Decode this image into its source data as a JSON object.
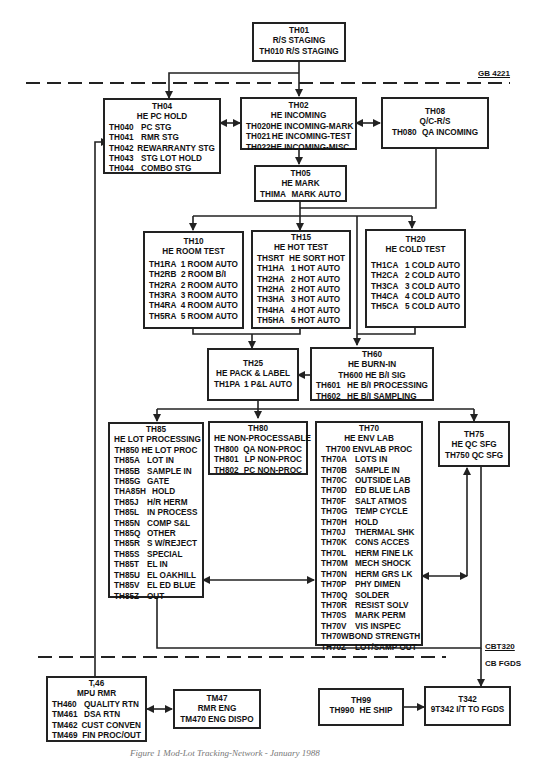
{
  "diagram": {
    "boundaries": {
      "top_label": "GB 4221",
      "bottom_label_top": "CBT320",
      "bottom_label_bottom": "CB FGDS"
    },
    "caption": "Figure 1 Mod-Lot Tracking-Network - January 1988",
    "nodes": {
      "th01": {
        "id": "TH01",
        "title": "R/S STAGING",
        "lines": [
          "TH010 R/S STAGING"
        ]
      },
      "th04": {
        "id": "TH04",
        "title": "HE PC HOLD",
        "rows": [
          {
            "code": "TH040",
            "desc": "PC STG"
          },
          {
            "code": "TH041",
            "desc": "RMR STG"
          },
          {
            "code": "TH042",
            "desc": "REWARRANTY STG"
          },
          {
            "code": "TH043",
            "desc": "STG LOT HOLD"
          },
          {
            "code": "TH044",
            "desc": "COMBO STG"
          }
        ]
      },
      "th02": {
        "id": "TH02",
        "title": "HE INCOMING",
        "rows": [
          {
            "code": "TH020",
            "desc": "HE INCOMING-MARK"
          },
          {
            "code": "TH021",
            "desc": "HE INCOMING-TEST"
          },
          {
            "code": "TH022",
            "desc": "HE INCOMING-MISC."
          }
        ]
      },
      "th08": {
        "id": "TH08",
        "title": "Q/C-R/S",
        "rows": [
          {
            "code": "TH080",
            "desc": "QA INCOMING"
          }
        ]
      },
      "th05": {
        "id": "TH05",
        "title": "HE MARK",
        "rows": [
          {
            "code": "THIMA",
            "desc": "MARK AUTO"
          }
        ]
      },
      "th10": {
        "id": "TH10",
        "title": "HE ROOM TEST",
        "rows": [
          {
            "code": "TH1RA",
            "desc": "1 ROOM AUTO"
          },
          {
            "code": "TH2RB",
            "desc": "2 ROOM B/I"
          },
          {
            "code": "TH2RA",
            "desc": "2 ROOM AUTO"
          },
          {
            "code": "TH3RA",
            "desc": "3 ROOM AUTO"
          },
          {
            "code": "TH4RA",
            "desc": "4 ROOM AUTO"
          },
          {
            "code": "TH5RA",
            "desc": "5 ROOM AUTO"
          }
        ]
      },
      "th15": {
        "id": "TH15",
        "title": "HE HOT TEST",
        "rows": [
          {
            "code": "THSRT",
            "desc": "HE SORT HOT"
          },
          {
            "code": "TH1HA",
            "desc": "1 HOT AUTO"
          },
          {
            "code": "TH2HA",
            "desc": "2 HOT AUTO"
          },
          {
            "code": "TH2HA",
            "desc": "2 HOT AUTO"
          },
          {
            "code": "TH3HA",
            "desc": "3 HOT AUTO"
          },
          {
            "code": "TH4HA",
            "desc": "4 HOT AUTO"
          },
          {
            "code": "TH5HA",
            "desc": "5 HOT AUTO"
          }
        ]
      },
      "th20": {
        "id": "TH20",
        "title": "HE COLD TEST",
        "rows": [
          {
            "code": "TH1CA",
            "desc": "1 COLD AUTO"
          },
          {
            "code": "TH2CA",
            "desc": "2 COLD AUTO"
          },
          {
            "code": "TH3CA",
            "desc": "3 COLD AUTO"
          },
          {
            "code": "TH4CA",
            "desc": "4 COLD AUTO"
          },
          {
            "code": "TH5CA",
            "desc": "5 COLD AUTO"
          }
        ]
      },
      "th25": {
        "id": "TH25",
        "title": "HE PACK & LABEL",
        "rows": [
          {
            "code": "TH1PA",
            "desc": "1 P&L AUTO"
          }
        ]
      },
      "th60": {
        "id": "TH60",
        "title": "HE BURN-IN",
        "subtitle": "TH600 HE B/I SIG",
        "rows": [
          {
            "code": "TH601",
            "desc": "HE B/I PROCESSING"
          },
          {
            "code": "TH602",
            "desc": "HE B/I SAMPLING"
          }
        ]
      },
      "th85": {
        "id": "TH85",
        "title": "HE LOT PROCESSING",
        "subtitle": "TH850 HE LOT PROC",
        "rows": [
          {
            "code": "TH85A",
            "desc": "LOT IN"
          },
          {
            "code": "TH85B",
            "desc": "SAMPLE IN"
          },
          {
            "code": "TH85G",
            "desc": "GATE"
          },
          {
            "code": "THA85H",
            "desc": "HOLD"
          },
          {
            "code": "TH85J",
            "desc": "H/R HERM"
          },
          {
            "code": "TH85L",
            "desc": "IN PROCESS"
          },
          {
            "code": "TH85N",
            "desc": "COMP S&L"
          },
          {
            "code": "TH85Q",
            "desc": "OTHER"
          },
          {
            "code": "TH85R",
            "desc": "S W/REJECT"
          },
          {
            "code": "TH85S",
            "desc": "SPECIAL"
          },
          {
            "code": "TH85T",
            "desc": "EL IN"
          },
          {
            "code": "TH85U",
            "desc": "EL OAKHILL"
          },
          {
            "code": "TH85V",
            "desc": "EL ED BLUE"
          },
          {
            "code": "TH85Z",
            "desc": "OUT"
          }
        ]
      },
      "th80": {
        "id": "TH80",
        "title": "HE NON-PROCESSABLE",
        "rows": [
          {
            "code": "TH800",
            "desc": "QA NON-PROC"
          },
          {
            "code": "TH801",
            "desc": "LP NON-PROC"
          },
          {
            "code": "TH802",
            "desc": "PC NON-PROC"
          }
        ]
      },
      "th70": {
        "id": "TH70",
        "title": "HE ENV LAB",
        "subtitle": "TH700 ENVLAB PROC",
        "rows": [
          {
            "code": "TH70A",
            "desc": "LOTS IN"
          },
          {
            "code": "TH70B",
            "desc": "SAMPLE IN"
          },
          {
            "code": "TH70C",
            "desc": "OUTSIDE LAB"
          },
          {
            "code": "TH70D",
            "desc": "ED BLUE LAB"
          },
          {
            "code": "TH70F",
            "desc": "SALT ATMOS"
          },
          {
            "code": "TH70G",
            "desc": "TEMP CYCLE"
          },
          {
            "code": "TH70H",
            "desc": "HOLD"
          },
          {
            "code": "TH70J",
            "desc": "THERMAL SHK"
          },
          {
            "code": "TH70K",
            "desc": "CONS ACCES"
          },
          {
            "code": "TH70L",
            "desc": "HERM FINE LK"
          },
          {
            "code": "TH70M",
            "desc": "MECH SHOCK"
          },
          {
            "code": "TH70N",
            "desc": "HERM GRS LK"
          },
          {
            "code": "TH70P",
            "desc": "PHY DIMEN"
          },
          {
            "code": "TH70Q",
            "desc": "SOLDER"
          },
          {
            "code": "TH70R",
            "desc": "RESIST SOLV"
          },
          {
            "code": "TH70S",
            "desc": "MARK PERM"
          },
          {
            "code": "TH70V",
            "desc": "VIS INSPEC"
          },
          {
            "code": "TH70W",
            "desc": "BOND STRENGTH"
          },
          {
            "code": "TH70Z",
            "desc": "LOT/SAMP OUT"
          }
        ]
      },
      "th75": {
        "id": "TH75",
        "title": "HE QC SFG",
        "lines": [
          "TH750 QC SFG"
        ]
      },
      "t46": {
        "id": "T,46",
        "title": "MPU RMR",
        "rows": [
          {
            "code": "TH460",
            "desc": "QUALITY RTN"
          },
          {
            "code": "TM461",
            "desc": "DSA RTN"
          },
          {
            "code": "TM462",
            "desc": "CUST CONVEN"
          },
          {
            "code": "TM469",
            "desc": "FIN PROC/OUT"
          }
        ]
      },
      "tm47": {
        "id": "TM47",
        "title": "RMR ENG",
        "lines": [
          "TM470 ENG DISPO"
        ]
      },
      "th99": {
        "id": "TH99",
        "rows": [
          {
            "code": "TH990",
            "desc": "HE SHIP"
          }
        ]
      },
      "t342": {
        "id": "T342",
        "lines": [
          "9T342 I/T TO FGDS"
        ]
      }
    }
  }
}
